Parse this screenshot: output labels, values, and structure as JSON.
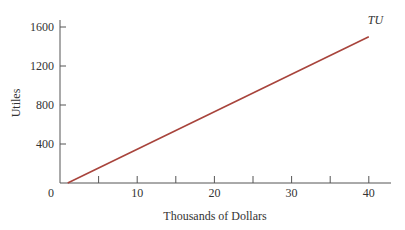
{
  "chart_data": {
    "type": "line",
    "title": "",
    "xlabel": "Thousands of Dollars",
    "ylabel": "Utiles",
    "xlim": [
      0,
      42
    ],
    "ylim": [
      0,
      1650
    ],
    "x_ticks": [
      0,
      10,
      20,
      30,
      40
    ],
    "x_tick_labels": [
      "0",
      "10",
      "20",
      "30",
      "40"
    ],
    "x_minor_ticks": [
      5,
      15,
      25,
      35
    ],
    "y_ticks": [
      400,
      800,
      1200,
      1600
    ],
    "y_tick_labels": [
      "400",
      "800",
      "1200",
      "1600"
    ],
    "grid": false,
    "legend": "none",
    "series": [
      {
        "name": "TU",
        "color": "#a8443c",
        "x": [
          1,
          40
        ],
        "y": [
          0,
          1500
        ]
      }
    ],
    "annotations": [
      {
        "text": "TU",
        "x": 40,
        "y": 1600,
        "style": "italic"
      }
    ]
  }
}
